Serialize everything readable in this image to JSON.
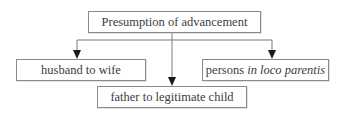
{
  "diagram": {
    "type": "tree",
    "root": {
      "label": "Presumption of advancement"
    },
    "children": [
      {
        "label": "husband to wife",
        "position": "left"
      },
      {
        "label": "father to legitimate child",
        "position": "center"
      },
      {
        "label_prefix": "persons ",
        "label_italic": "in loco parentis",
        "position": "right"
      }
    ],
    "edges": [
      {
        "from": "Presumption of advancement",
        "to": "husband to wife"
      },
      {
        "from": "Presumption of advancement",
        "to": "father to legitimate child"
      },
      {
        "from": "Presumption of advancement",
        "to": "persons in loco parentis"
      }
    ],
    "colors": {
      "line": "#7a7a7a",
      "arrow": "#1a1a1a",
      "box_border": "#8a8a8a",
      "text": "#3c3c3c"
    }
  }
}
